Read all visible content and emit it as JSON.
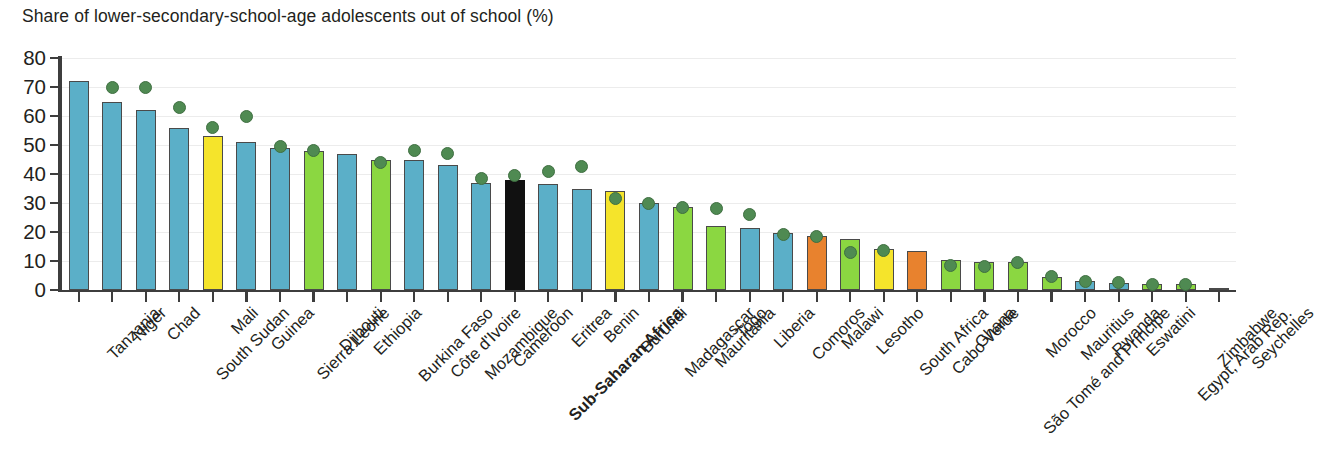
{
  "chart": {
    "title": "Share of lower-secondary-school-age adolescents out of school (%)"
  },
  "axes": {
    "y_ticks": [
      "0",
      "10",
      "20",
      "30",
      "40",
      "50",
      "60",
      "70",
      "80"
    ],
    "y_min": 0,
    "y_max": 80
  },
  "chart_data": {
    "type": "bar",
    "title": "Share of lower-secondary-school-age adolescents out of school (%)",
    "xlabel": "",
    "ylabel": "",
    "ylim": [
      0,
      80
    ],
    "grid": true,
    "legend": "none",
    "categories": [
      "Tanzania",
      "Niger",
      "Chad",
      "South Sudan",
      "Mali",
      "Guinea",
      "Sierra Leone",
      "Djibouti",
      "Ethiopia",
      "Burkina Faso",
      "Côte d'Ivoire",
      "Mozambique",
      "Cameroon",
      "Sub-Saharan Africa",
      "Eritrea",
      "Benin",
      "Burundi",
      "Madagascar",
      "Mauritania",
      "Togo",
      "Liberia",
      "Comoros",
      "Malawi",
      "Lesotho",
      "South Africa",
      "Cabo Verde",
      "Ghana",
      "São Tomé and Príncipe",
      "Morocco",
      "Mauritius",
      "Rwanda",
      "Eswatini",
      "Egypt, Arab Rep.",
      "Zimbabwe",
      "Seychelles"
    ],
    "series": [
      {
        "name": "Out-of-school rate (%)",
        "type": "bar",
        "values": [
          72,
          65,
          62,
          56,
          53,
          51,
          49,
          48,
          47,
          45,
          45,
          43,
          37,
          38,
          36.5,
          35,
          34,
          30,
          28.5,
          22,
          21.5,
          19.5,
          18.5,
          17.5,
          14,
          13.5,
          10.5,
          9.5,
          9.5,
          4.5,
          3,
          2.5,
          2,
          2,
          0.5
        ]
      },
      {
        "name": "Comparison marker",
        "type": "scatter",
        "values": [
          null,
          70,
          70,
          63,
          56,
          60,
          49.5,
          48,
          null,
          44,
          48,
          47,
          38.5,
          39.5,
          41,
          42.5,
          31.5,
          30,
          28.5,
          28,
          26,
          19,
          18.5,
          13,
          13.5,
          null,
          8.5,
          8,
          9.5,
          4.5,
          3,
          2.5,
          2,
          2,
          null
        ]
      }
    ],
    "bar_colors": [
      "#5BAFC8",
      "#5BAFC8",
      "#5BAFC8",
      "#5BAFC8",
      "#F5E42B",
      "#5BAFC8",
      "#5BAFC8",
      "#8BD741",
      "#5BAFC8",
      "#8BD741",
      "#5BAFC8",
      "#5BAFC8",
      "#5BAFC8",
      "#111111",
      "#5BAFC8",
      "#5BAFC8",
      "#F5E42B",
      "#5BAFC8",
      "#8BD741",
      "#8BD741",
      "#5BAFC8",
      "#5BAFC8",
      "#E8822E",
      "#8BD741",
      "#F5E42B",
      "#E8822E",
      "#8BD741",
      "#8BD741",
      "#8BD741",
      "#8BD741",
      "#5BAFC8",
      "#5BAFC8",
      "#8BD741",
      "#8BD741",
      "#8C7A3A"
    ],
    "marker_color": "#4F8A52",
    "highlight_category": "Sub-Saharan Africa",
    "highlight_color": "#111111"
  }
}
